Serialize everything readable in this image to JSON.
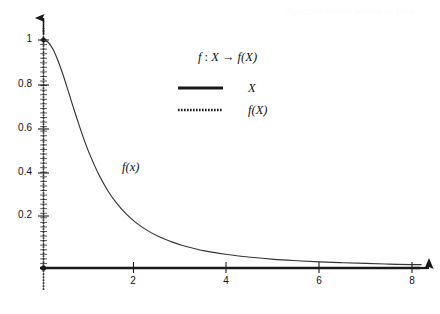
{
  "chart_data": {
    "type": "line",
    "title": "",
    "xlabel": "",
    "ylabel": "",
    "xlim": [
      0,
      8.2
    ],
    "ylim": [
      0,
      1.05
    ],
    "grid": false,
    "x_ticks": [
      2,
      4,
      6,
      8
    ],
    "x_tick_labels": [
      "2",
      "4",
      "6",
      "8"
    ],
    "y_ticks": [
      0.2,
      0.4,
      0.6,
      0.8,
      1
    ],
    "y_tick_labels": [
      "0.2",
      "0.4",
      "0.6",
      "0.8",
      "1"
    ],
    "x_minor_ticks_visible": false,
    "y_minor_ticks_visible": true,
    "axis_arrows": true,
    "annotations": [
      {
        "text": "f(x)",
        "x": 1.75,
        "y": 0.44
      }
    ],
    "series": [
      {
        "name": "f(x)",
        "style": "solid",
        "color": "#333333",
        "x": [
          0,
          0.1,
          0.2,
          0.3,
          0.4,
          0.5,
          0.6,
          0.7,
          0.8,
          0.9,
          1,
          1.2,
          1.4,
          1.6,
          1.8,
          2,
          2.25,
          2.5,
          2.75,
          3,
          3.5,
          4,
          4.5,
          5,
          5.5,
          6,
          6.5,
          7,
          7.5,
          8,
          8.2
        ],
        "y": [
          1,
          0.99,
          0.962,
          0.917,
          0.862,
          0.8,
          0.735,
          0.671,
          0.61,
          0.552,
          0.5,
          0.41,
          0.338,
          0.281,
          0.236,
          0.2,
          0.165,
          0.138,
          0.117,
          0.1,
          0.075,
          0.059,
          0.047,
          0.038,
          0.032,
          0.027,
          0.023,
          0.02,
          0.017,
          0.015,
          0.015
        ]
      }
    ],
    "legend": {
      "position": "upper-center",
      "title": "f : X → f(X)",
      "title_parts": {
        "f": "f",
        "colon": " : ",
        "X": "X",
        "arrow": " → ",
        "fX": "f(X)"
      },
      "entries": [
        {
          "label": "X",
          "style": "solid"
        },
        {
          "label": "f(X)",
          "style": "dotted"
        }
      ]
    }
  },
  "bleed_text": "faint scanned bleed-through"
}
